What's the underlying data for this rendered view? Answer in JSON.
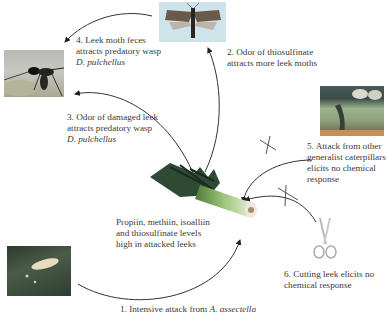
{
  "diagram": {
    "type": "cycle",
    "center": {
      "name": "leek",
      "caption": [
        "Propiin, methiin, isoalliin",
        "and thiosulfinate levels",
        "high in attacked leeks"
      ]
    },
    "steps": [
      {
        "id": 1,
        "lines": [
          "1. Intensive attack from "
        ],
        "italic": "A. assectella",
        "image": "leek-moth-larva-photo"
      },
      {
        "id": 2,
        "lines": [
          "2. Odor of thiosulfinate",
          "attracts more leek moths"
        ],
        "image": "leek-moth-adult-photo"
      },
      {
        "id": 3,
        "lines": [
          "3. Odor of damaged leek",
          "attracts predatory wasp"
        ],
        "italic": "D. pulchellus"
      },
      {
        "id": 4,
        "lines": [
          "4. Leek moth feces",
          "attracts predatory wasp"
        ],
        "italic": "D. pulchellus",
        "image": "predatory-wasp-photo"
      },
      {
        "id": 5,
        "lines": [
          "5. Attack from other",
          "generalist caterpillars",
          "elicits no chemical",
          "response"
        ],
        "image": "generalist-caterpillar-photo",
        "blocked": true
      },
      {
        "id": 6,
        "lines": [
          "6. Cutting  leek elicits no",
          "chemical response"
        ],
        "image": "scissors-icon",
        "blocked": true
      }
    ]
  }
}
